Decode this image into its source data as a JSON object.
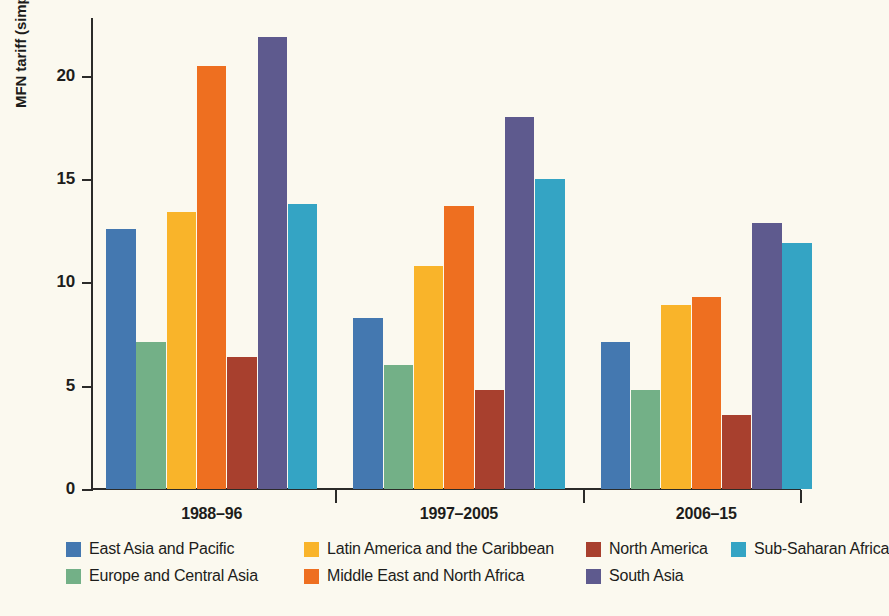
{
  "chart_data": {
    "type": "bar",
    "title": "",
    "subtitle": "",
    "xlabel": "",
    "ylabel": "MFN tariff (simple average)",
    "categories": [
      "1988–96",
      "1997–2005",
      "2006–15"
    ],
    "ylim": [
      0,
      22.8
    ],
    "yticks": [
      0,
      5,
      10,
      15,
      20
    ],
    "ytick_labels": [
      "0",
      "5",
      "10",
      "15",
      "20"
    ],
    "grid": false,
    "legend_position": "bottom",
    "series": [
      {
        "name": "East Asia and Pacific",
        "color": "#4478b0",
        "values": [
          12.6,
          8.3,
          7.1
        ]
      },
      {
        "name": "Europe and Central Asia",
        "color": "#73b087",
        "values": [
          7.1,
          6.0,
          4.8
        ]
      },
      {
        "name": "Latin America and the Caribbean",
        "color": "#f9b42a",
        "values": [
          13.4,
          10.8,
          8.9
        ]
      },
      {
        "name": "Middle East and North Africa",
        "color": "#ee6f20",
        "values": [
          20.5,
          13.7,
          9.3
        ]
      },
      {
        "name": "North America",
        "color": "#a8402e",
        "values": [
          6.4,
          4.8,
          3.6
        ]
      },
      {
        "name": "South Asia",
        "color": "#5e5a8e",
        "values": [
          21.9,
          18.0,
          12.9
        ]
      },
      {
        "name": "Sub-Saharan Africa",
        "color": "#34a4c4",
        "values": [
          13.8,
          15.0,
          11.9
        ]
      }
    ]
  },
  "legend_layout": {
    "columns": [
      {
        "left": 0,
        "entries": [
          0,
          1
        ]
      },
      {
        "left": 238,
        "entries": [
          2,
          3
        ]
      },
      {
        "left": 520,
        "entries": [
          4,
          5
        ]
      },
      {
        "left": 665,
        "entries": [
          6
        ]
      }
    ]
  },
  "colors": {
    "background": "#fbf9ef",
    "axis": "#2b2b29",
    "text": "#1d1d1b"
  }
}
